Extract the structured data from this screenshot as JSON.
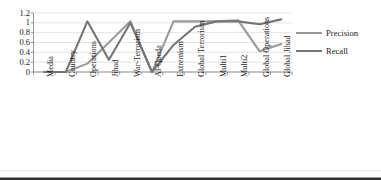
{
  "chart_data": {
    "type": "line",
    "title": "",
    "xlabel": "",
    "ylabel": "",
    "ylim": [
      0,
      1.2
    ],
    "grid": true,
    "legend_position": "right",
    "categories": [
      "Media",
      "Country",
      "Operations",
      "Jihad",
      "War-Terrorism",
      "Al-Qaeda",
      "Extremism",
      "Global Terrorism",
      "Multi1",
      "Multi2",
      "Global Operations",
      "Global Jihad"
    ],
    "ytick_labels": [
      "1.2",
      "1",
      "0.8",
      "0.6",
      "0.4",
      "0.2",
      "0"
    ],
    "ytick_values": [
      1.2,
      1.0,
      0.8,
      0.6,
      0.4,
      0.2,
      0
    ],
    "series": [
      {
        "name": "Precision",
        "color": "#9a9a9a",
        "values": [
          0,
          0,
          0.17,
          0.6,
          1.03,
          0,
          1.03,
          1.03,
          1.03,
          1.05,
          0.42,
          0.57
        ]
      },
      {
        "name": "Recall",
        "color": "#757575",
        "values": [
          0,
          0,
          1.03,
          0.25,
          1.0,
          0,
          0.55,
          0.92,
          1.03,
          1.03,
          0.97,
          1.07
        ]
      }
    ]
  },
  "legend": {
    "items": [
      {
        "label": "Precision",
        "color": "#9a9a9a"
      },
      {
        "label": "Recall",
        "color": "#757575"
      }
    ]
  },
  "axis": {
    "axis_color": "#8a8a8a",
    "grid_color": "#d9d9d9"
  }
}
